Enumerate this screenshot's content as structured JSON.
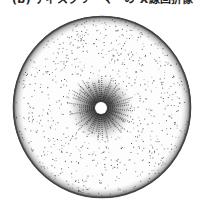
{
  "figure": {
    "caption": "(b) ディスクリーマーの X線回折像",
    "pattern": {
      "center": [
        101,
        108
      ],
      "outer_radius": 89,
      "hole_radius": 6,
      "ring_color": "#3a3a3a",
      "speckle_color": "#2b2b2b",
      "background": "#ffffff"
    }
  }
}
